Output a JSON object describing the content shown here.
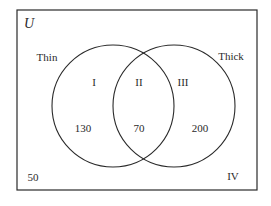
{
  "diagram": {
    "type": "venn",
    "universe_label": "U",
    "sets": [
      {
        "name": "Thin",
        "region_label": "I",
        "only_count": "130"
      },
      {
        "name": "Thick",
        "region_label": "III",
        "only_count": "200"
      }
    ],
    "intersection": {
      "region_label": "II",
      "count": "70"
    },
    "outside": {
      "region_label": "IV",
      "count": "50"
    }
  },
  "colors": {
    "stroke": "#2a2a2a",
    "background": "#ffffff"
  }
}
